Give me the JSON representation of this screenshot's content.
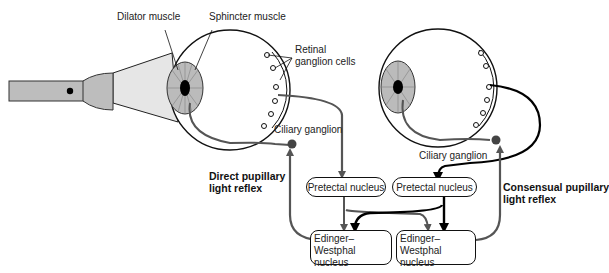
{
  "diagram": {
    "labels": {
      "dilator_muscle": "Dilator muscle",
      "sphincter_muscle": "Sphincter muscle",
      "retinal_ganglion_line1": "Retinal",
      "retinal_ganglion_line2": "ganglion cells",
      "ciliary_ganglion_left": "Ciliary ganglion",
      "ciliary_ganglion_right": "Ciliary ganglion",
      "direct_reflex_line1": "Direct pupillary",
      "direct_reflex_line2": "light reflex",
      "consensual_reflex_line1": "Consensual pupillary",
      "consensual_reflex_line2": "light reflex"
    },
    "nodes": {
      "pretectal_left": "Pretectal nucleus",
      "pretectal_right": "Pretectal nucleus",
      "ew_left_line1": "Edinger–Westphal",
      "ew_left_line2": "nucleus",
      "ew_right_line1": "Edinger–Westphal",
      "ew_right_line2": "nucleus"
    },
    "colors": {
      "gray_path": "#555555",
      "black_path": "#000000",
      "flashlight": "#bdbdbd",
      "beam": "#e6e6e6",
      "ganglion_dot": "#444444"
    }
  }
}
